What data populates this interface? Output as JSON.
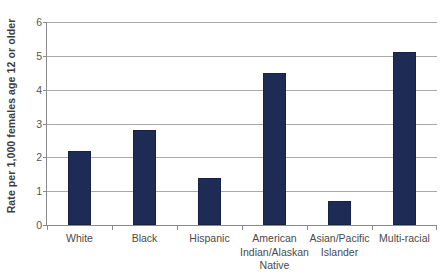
{
  "chart_data": {
    "type": "bar",
    "title": "",
    "subtitle": "",
    "xlabel": "",
    "ylabel": "Rate per 1,000 females age 12 or older",
    "categories": [
      "White",
      "Black",
      "Hispanic",
      "American Indian/Alaskan Native",
      "Asian/Pacific Islander",
      "Multi-racial"
    ],
    "category_lines": [
      [
        "White"
      ],
      [
        "Black"
      ],
      [
        "Hispanic"
      ],
      [
        "American",
        "Indian/Alaskan",
        "Native"
      ],
      [
        "Asian/Pacific",
        "Islander"
      ],
      [
        "Multi-racial"
      ]
    ],
    "values": [
      2.2,
      2.8,
      1.4,
      4.5,
      0.7,
      5.1
    ],
    "ylim": [
      0,
      6
    ],
    "ytick_labels": [
      "0",
      "1",
      "2",
      "3",
      "4",
      "5",
      "6"
    ],
    "ytick_values": [
      0,
      1,
      2,
      3,
      4,
      5,
      6
    ],
    "grid": true,
    "grid_axis": "y",
    "legend": false,
    "legend_position": "none",
    "bar_color": "#1d2b55",
    "grid_color": "#a9a9a9",
    "axis_color": "#8a8a8a",
    "background_color": "#ffffff"
  }
}
